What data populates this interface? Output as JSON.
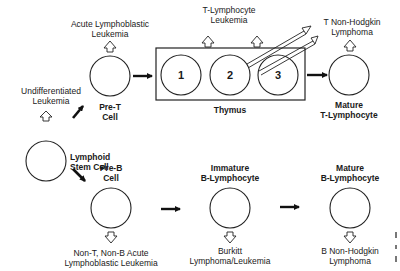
{
  "diagram": {
    "type": "lymphocyte differentiation pathway with associated malignancies",
    "colors": {
      "ink": "#222222",
      "background": "#ffffff"
    },
    "nodes": {
      "stem": {
        "label_lines": [
          "Lymphoid",
          "Stem Cell"
        ],
        "disease_lines": [
          "Undifferentiated",
          "Leukemia"
        ]
      },
      "pre_t": {
        "label_lines": [
          "Pre-T",
          "Cell"
        ],
        "disease_lines": [
          "Acute Lymphoblastic",
          "Leukemia"
        ]
      },
      "thymus": {
        "label": "Thymus",
        "stages": [
          "1",
          "2",
          "3"
        ],
        "disease_lines": [
          "T-Lymphocyte",
          "Leukemia"
        ]
      },
      "mature_t": {
        "label_lines": [
          "Mature",
          "T-Lymphocyte"
        ],
        "disease_lines": [
          "T Non-Hodgkin",
          "Lymphoma"
        ]
      },
      "pre_b": {
        "label_lines": [
          "Pre-B",
          "Cell"
        ],
        "disease_lines": [
          "Non-T, Non-B Acute",
          "Lymphoblastic Leukemia"
        ]
      },
      "immature_b": {
        "label_lines": [
          "Immature",
          "B-Lymphocyte"
        ],
        "disease_lines": [
          "Burkitt",
          "Lymphoma/Leukemia"
        ]
      },
      "mature_b": {
        "label_lines": [
          "Mature",
          "B-Lymphocyte"
        ],
        "disease_lines": [
          "B Non-Hodgkin",
          "Lymphoma"
        ]
      }
    },
    "edges": [
      {
        "from": "stem",
        "to": "pre_t"
      },
      {
        "from": "stem",
        "to": "pre_b"
      },
      {
        "from": "pre_t",
        "to": "thymus"
      },
      {
        "from": "thymus",
        "to": "mature_t"
      },
      {
        "from": "pre_b",
        "to": "immature_b"
      },
      {
        "from": "immature_b",
        "to": "mature_b"
      }
    ]
  }
}
